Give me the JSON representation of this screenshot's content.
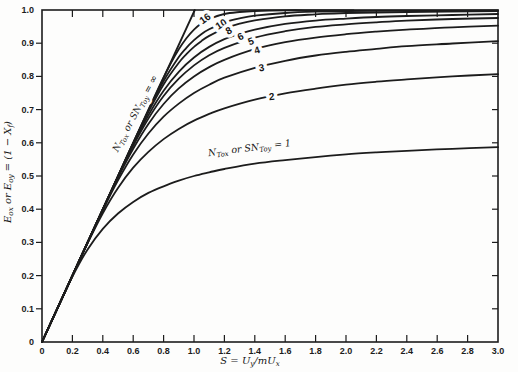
{
  "figure": {
    "background": "#fdfdfc",
    "ink": "#1c1c1c"
  },
  "chart_data": {
    "type": "line",
    "title": "",
    "grid": false,
    "legend": "curve labels inline",
    "x_axis": {
      "label_text": "S = Uy/mUx",
      "label_parts": [
        {
          "t": "S = U"
        },
        {
          "t": "y",
          "sub": true
        },
        {
          "t": "/mU"
        },
        {
          "t": "x",
          "sub": true
        }
      ],
      "min": 0,
      "max": 3.0,
      "ticks": [
        0,
        0.2,
        0.4,
        0.6,
        0.8,
        1.0,
        1.2,
        1.4,
        1.6,
        1.8,
        2.0,
        2.2,
        2.4,
        2.6,
        2.8,
        3.0
      ],
      "tick_labels": [
        "0",
        "0.2",
        "0.4",
        "0.6",
        "0.8",
        "1.0",
        "1.2",
        "1.4",
        "1.6",
        "1.8",
        "2.0",
        "2.2",
        "2.4",
        "2.6",
        "2.8",
        "3.0"
      ]
    },
    "y_axis": {
      "label_text": "Eox or Eoy = (1 − Xf)",
      "label_parts": [
        {
          "t": "E"
        },
        {
          "t": "ox",
          "sub": true
        },
        {
          "t": " or E"
        },
        {
          "t": "oy",
          "sub": true
        },
        {
          "t": " = (1 − X"
        },
        {
          "t": "f",
          "sub": true
        },
        {
          "t": ")"
        }
      ],
      "min": 0,
      "max": 1.0,
      "ticks": [
        0,
        0.1,
        0.2,
        0.3,
        0.4,
        0.5,
        0.6,
        0.7,
        0.8,
        0.9,
        1.0
      ],
      "tick_labels": [
        "0",
        "0.1",
        "0.2",
        "0.3",
        "0.4",
        "0.5",
        "0.6",
        "0.7",
        "0.8",
        "0.9",
        "1.0"
      ]
    },
    "series": [
      {
        "name": "inf",
        "n_value": "infinity",
        "label": null,
        "points": [
          [
            0,
            0
          ],
          [
            1.005,
            1.0
          ]
        ]
      },
      {
        "name": "16",
        "n_value": 16,
        "label": "16",
        "label_pos": [
          1.085,
          0.975
        ],
        "label_rot": -36,
        "points": [
          [
            0,
            0
          ],
          [
            0.3,
            0.3
          ],
          [
            0.5,
            0.5
          ],
          [
            0.6,
            0.6
          ],
          [
            0.7,
            0.7
          ],
          [
            0.75,
            0.749
          ],
          [
            0.8,
            0.797
          ],
          [
            0.85,
            0.842
          ],
          [
            0.9,
            0.882
          ],
          [
            0.95,
            0.915
          ],
          [
            1.0,
            0.941
          ],
          [
            1.05,
            0.96
          ],
          [
            1.1,
            0.973
          ],
          [
            1.2,
            0.988
          ],
          [
            1.3,
            0.994
          ],
          [
            1.4,
            0.997
          ],
          [
            1.6,
            0.999
          ],
          [
            1.8,
            0.999
          ],
          [
            2.05,
            0.999
          ]
        ]
      },
      {
        "name": "10",
        "n_value": 10,
        "label": "10",
        "label_pos": [
          1.191,
          0.958
        ],
        "label_rot": -33,
        "points": [
          [
            0,
            0
          ],
          [
            0.3,
            0.3
          ],
          [
            0.5,
            0.5
          ],
          [
            0.6,
            0.6
          ],
          [
            0.7,
            0.697
          ],
          [
            0.8,
            0.786
          ],
          [
            0.9,
            0.858
          ],
          [
            0.95,
            0.886
          ],
          [
            1.0,
            0.909
          ],
          [
            1.05,
            0.928
          ],
          [
            1.1,
            0.942
          ],
          [
            1.2,
            0.963
          ],
          [
            1.3,
            0.975
          ],
          [
            1.4,
            0.983
          ],
          [
            1.6,
            0.991
          ],
          [
            1.8,
            0.995
          ],
          [
            2.0,
            0.997
          ],
          [
            2.4,
            0.998
          ],
          [
            3.0,
            0.999
          ]
        ]
      },
      {
        "name": "8",
        "n_value": 8,
        "label": "8",
        "label_pos": [
          1.24,
          0.938
        ],
        "label_rot": -30,
        "points": [
          [
            0,
            0
          ],
          [
            0.3,
            0.3
          ],
          [
            0.5,
            0.5
          ],
          [
            0.6,
            0.599
          ],
          [
            0.7,
            0.693
          ],
          [
            0.8,
            0.776
          ],
          [
            0.9,
            0.841
          ],
          [
            0.95,
            0.867
          ],
          [
            1.0,
            0.889
          ],
          [
            1.05,
            0.907
          ],
          [
            1.1,
            0.922
          ],
          [
            1.2,
            0.944
          ],
          [
            1.3,
            0.959
          ],
          [
            1.4,
            0.969
          ],
          [
            1.6,
            0.981
          ],
          [
            1.8,
            0.987
          ],
          [
            2.0,
            0.991
          ],
          [
            2.4,
            0.994
          ],
          [
            3.0,
            0.997
          ]
        ]
      },
      {
        "name": "6",
        "n_value": 6,
        "label": "6",
        "label_pos": [
          1.316,
          0.92
        ],
        "label_rot": -26,
        "points": [
          [
            0,
            0
          ],
          [
            0.3,
            0.3
          ],
          [
            0.5,
            0.499
          ],
          [
            0.6,
            0.596
          ],
          [
            0.7,
            0.683
          ],
          [
            0.8,
            0.757
          ],
          [
            0.9,
            0.814
          ],
          [
            1.0,
            0.857
          ],
          [
            1.1,
            0.889
          ],
          [
            1.2,
            0.912
          ],
          [
            1.3,
            0.928
          ],
          [
            1.4,
            0.941
          ],
          [
            1.6,
            0.958
          ],
          [
            1.8,
            0.968
          ],
          [
            2.0,
            0.974
          ],
          [
            2.2,
            0.979
          ],
          [
            2.4,
            0.982
          ],
          [
            2.7,
            0.985
          ],
          [
            3.0,
            0.988
          ]
        ]
      },
      {
        "name": "5",
        "n_value": 5,
        "label": "5",
        "label_pos": [
          1.382,
          0.905
        ],
        "label_rot": -21,
        "points": [
          [
            0,
            0
          ],
          [
            0.3,
            0.3
          ],
          [
            0.5,
            0.498
          ],
          [
            0.6,
            0.591
          ],
          [
            0.7,
            0.673
          ],
          [
            0.8,
            0.741
          ],
          [
            0.9,
            0.793
          ],
          [
            1.0,
            0.833
          ],
          [
            1.1,
            0.864
          ],
          [
            1.2,
            0.886
          ],
          [
            1.4,
            0.917
          ],
          [
            1.6,
            0.936
          ],
          [
            1.8,
            0.949
          ],
          [
            2.0,
            0.957
          ],
          [
            2.2,
            0.963
          ],
          [
            2.4,
            0.968
          ],
          [
            2.7,
            0.973
          ],
          [
            3.0,
            0.976
          ]
        ]
      },
      {
        "name": "4",
        "n_value": 4,
        "label": "4",
        "label_pos": [
          1.421,
          0.878
        ],
        "label_rot": -16,
        "points": [
          [
            0,
            0
          ],
          [
            0.3,
            0.3
          ],
          [
            0.4,
            0.399
          ],
          [
            0.5,
            0.495
          ],
          [
            0.6,
            0.582
          ],
          [
            0.7,
            0.657
          ],
          [
            0.8,
            0.717
          ],
          [
            0.9,
            0.764
          ],
          [
            1.0,
            0.8
          ],
          [
            1.1,
            0.828
          ],
          [
            1.2,
            0.85
          ],
          [
            1.4,
            0.882
          ],
          [
            1.6,
            0.903
          ],
          [
            1.8,
            0.917
          ],
          [
            2.0,
            0.927
          ],
          [
            2.2,
            0.935
          ],
          [
            2.4,
            0.941
          ],
          [
            2.7,
            0.948
          ],
          [
            3.0,
            0.953
          ]
        ]
      },
      {
        "name": "3",
        "n_value": 3,
        "label": "3",
        "label_pos": [
          1.447,
          0.825
        ],
        "label_rot": -9,
        "points": [
          [
            0,
            0
          ],
          [
            0.2,
            0.2
          ],
          [
            0.3,
            0.3
          ],
          [
            0.4,
            0.397
          ],
          [
            0.5,
            0.487
          ],
          [
            0.6,
            0.565
          ],
          [
            0.7,
            0.628
          ],
          [
            0.8,
            0.679
          ],
          [
            0.9,
            0.718
          ],
          [
            1.0,
            0.75
          ],
          [
            1.1,
            0.775
          ],
          [
            1.2,
            0.796
          ],
          [
            1.4,
            0.826
          ],
          [
            1.6,
            0.847
          ],
          [
            1.8,
            0.863
          ],
          [
            2.0,
            0.874
          ],
          [
            2.2,
            0.883
          ],
          [
            2.4,
            0.891
          ],
          [
            2.7,
            0.899
          ],
          [
            3.0,
            0.906
          ]
        ]
      },
      {
        "name": "2",
        "n_value": 2,
        "label": "2",
        "label_pos": [
          1.513,
          0.738
        ],
        "label_rot": -6,
        "points": [
          [
            0,
            0
          ],
          [
            0.2,
            0.2
          ],
          [
            0.3,
            0.298
          ],
          [
            0.4,
            0.388
          ],
          [
            0.5,
            0.464
          ],
          [
            0.6,
            0.525
          ],
          [
            0.7,
            0.573
          ],
          [
            0.8,
            0.611
          ],
          [
            0.9,
            0.642
          ],
          [
            1.0,
            0.667
          ],
          [
            1.1,
            0.687
          ],
          [
            1.2,
            0.704
          ],
          [
            1.4,
            0.73
          ],
          [
            1.6,
            0.749
          ],
          [
            1.8,
            0.763
          ],
          [
            2.0,
            0.775
          ],
          [
            2.2,
            0.784
          ],
          [
            2.4,
            0.791
          ],
          [
            2.7,
            0.8
          ],
          [
            3.0,
            0.807
          ]
        ]
      },
      {
        "name": "1",
        "n_value": 1,
        "label": null,
        "points": [
          [
            0,
            0
          ],
          [
            0.1,
            0.1
          ],
          [
            0.2,
            0.197
          ],
          [
            0.3,
            0.279
          ],
          [
            0.4,
            0.341
          ],
          [
            0.5,
            0.387
          ],
          [
            0.6,
            0.422
          ],
          [
            0.7,
            0.449
          ],
          [
            0.8,
            0.469
          ],
          [
            0.9,
            0.486
          ],
          [
            1.0,
            0.5
          ],
          [
            1.1,
            0.511
          ],
          [
            1.2,
            0.521
          ],
          [
            1.4,
            0.537
          ],
          [
            1.6,
            0.548
          ],
          [
            1.8,
            0.557
          ],
          [
            2.0,
            0.565
          ],
          [
            2.2,
            0.571
          ],
          [
            2.4,
            0.576
          ],
          [
            2.7,
            0.582
          ],
          [
            3.0,
            0.587
          ]
        ]
      }
    ],
    "annotations": [
      {
        "name": "ntu-infinity",
        "text": "NTox or SNToy = ∞",
        "parts": [
          {
            "t": "N"
          },
          {
            "t": "Tox",
            "sub": true
          },
          {
            "t": " or SN"
          },
          {
            "t": "Toy",
            "sub": true
          },
          {
            "t": " = ∞"
          }
        ],
        "pos": [
          0.63,
          0.684
        ],
        "rot": -62
      },
      {
        "name": "ntu-one",
        "text": "NTox or SNToy = 1",
        "parts": [
          {
            "t": "N"
          },
          {
            "t": "Tox",
            "sub": true
          },
          {
            "t": " or SN"
          },
          {
            "t": "Toy",
            "sub": true
          },
          {
            "t": " = 1"
          }
        ],
        "pos": [
          1.368,
          0.575
        ],
        "rot": -7
      }
    ]
  }
}
